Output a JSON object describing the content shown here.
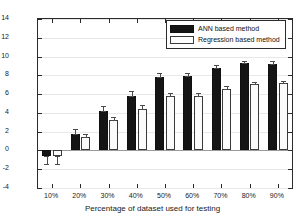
{
  "chart_data": {
    "type": "bar",
    "title": "",
    "xlabel": "Percentage of dataset used for testing",
    "ylabel": "Error Mean",
    "categories": [
      "10%",
      "20%",
      "30%",
      "40%",
      "50%",
      "60%",
      "70%",
      "80%",
      "90%"
    ],
    "ylim": [
      -4,
      14
    ],
    "yticks": [
      -4,
      -2,
      0,
      2,
      4,
      6,
      8,
      10,
      12,
      14
    ],
    "ytick_labels": [
      "-4",
      "-2",
      "0",
      "2",
      "4",
      "6",
      "8",
      "10",
      "12",
      "14"
    ],
    "grid": true,
    "legend_position": "top-right",
    "series": [
      {
        "name": "ANN based method",
        "color": "#151515",
        "values": [
          -0.6,
          1.8,
          4.25,
          5.85,
          7.85,
          7.9,
          8.8,
          9.3,
          9.25
        ],
        "errors": [
          0.85,
          0.45,
          0.45,
          0.45,
          0.45,
          0.3,
          0.35,
          0.25,
          0.3
        ]
      },
      {
        "name": "Regression based method",
        "color": "#fbfbfb",
        "values": [
          -0.55,
          1.4,
          3.2,
          4.45,
          5.8,
          5.85,
          6.5,
          7.05,
          7.15
        ],
        "errors": [
          0.9,
          0.4,
          0.35,
          0.35,
          0.35,
          0.3,
          0.35,
          0.25,
          0.25
        ]
      }
    ]
  },
  "legend": {
    "items": [
      {
        "label": "ANN based method",
        "swatch": "filled-black-swatch"
      },
      {
        "label": "Regression based method",
        "swatch": "outlined-white-swatch"
      }
    ]
  }
}
